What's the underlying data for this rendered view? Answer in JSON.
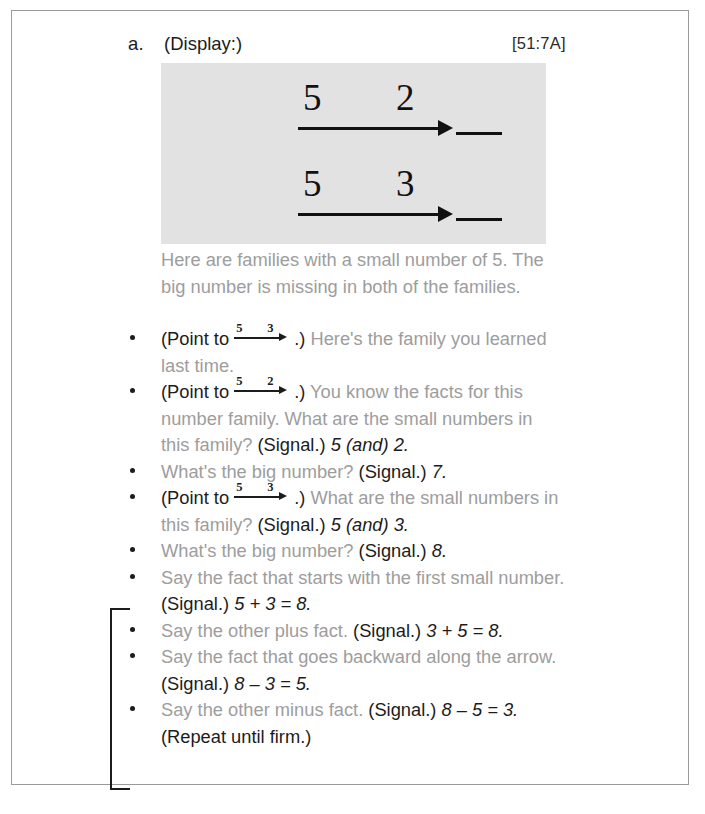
{
  "page": {
    "item_letter": "a.",
    "display_label": "(Display:)",
    "reference_code": "[51:7A]"
  },
  "display": {
    "families": [
      {
        "small_left": "5",
        "small_right": "2",
        "big_number": ""
      },
      {
        "small_left": "5",
        "small_right": "3",
        "big_number": ""
      }
    ]
  },
  "intro": "Here are families with a small number of 5. The big number is missing in both of the families.",
  "bullets": [
    {
      "point_to_prefix": "(Point to ",
      "arrow": {
        "left": "5",
        "right": "3"
      },
      "point_to_suffix": ".)",
      "teacher_text": " Here's the family you learned last time.",
      "signal": "",
      "answer": ""
    },
    {
      "point_to_prefix": "(Point to ",
      "arrow": {
        "left": "5",
        "right": "2"
      },
      "point_to_suffix": ".)",
      "teacher_text": " You know the facts for this number family. What are the small numbers in this family? ",
      "signal": "(Signal.)",
      "answer": " 5 (and) 2."
    },
    {
      "point_to_prefix": "",
      "arrow": null,
      "point_to_suffix": "",
      "teacher_text": "What's the big number? ",
      "signal": "(Signal.)",
      "answer": " 7."
    },
    {
      "point_to_prefix": "(Point to ",
      "arrow": {
        "left": "5",
        "right": "3"
      },
      "point_to_suffix": ".)",
      "teacher_text": " What are the small numbers in this family? ",
      "signal": "(Signal.)",
      "answer": " 5 (and) 3."
    },
    {
      "point_to_prefix": "",
      "arrow": null,
      "point_to_suffix": "",
      "teacher_text": "What's the big number? ",
      "signal": "(Signal.)",
      "answer": " 8."
    },
    {
      "point_to_prefix": "",
      "arrow": null,
      "point_to_suffix": "",
      "teacher_text": "Say the fact that starts with the first small number. ",
      "signal": "(Signal.)",
      "answer": " 5 + 3 = 8."
    },
    {
      "point_to_prefix": "",
      "arrow": null,
      "point_to_suffix": "",
      "teacher_text": "Say the other plus fact. ",
      "signal": "(Signal.)",
      "answer": " 3 + 5 = 8."
    },
    {
      "point_to_prefix": "",
      "arrow": null,
      "point_to_suffix": "",
      "teacher_text": "Say the fact that goes backward along the arrow. ",
      "signal": "(Signal.)",
      "answer": " 8 – 3 = 5."
    },
    {
      "point_to_prefix": "",
      "arrow": null,
      "point_to_suffix": "",
      "teacher_text": "Say the other minus fact. ",
      "signal": "(Signal.)",
      "answer": " 8 – 5 = 3."
    }
  ],
  "repeat_note": "(Repeat until firm.)",
  "colors": {
    "gray_text": "#9d9d9d",
    "dark_text": "#1c1c1c",
    "display_panel": "#e2e2e2",
    "page_border": "#9b9b9b"
  }
}
